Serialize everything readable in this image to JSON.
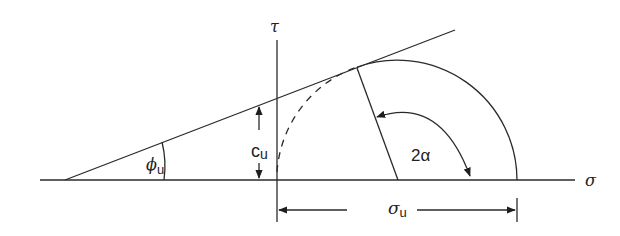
{
  "diagram": {
    "colors": {
      "stroke": "#2a2a2a",
      "background": "#ffffff"
    },
    "labels": {
      "tau_axis": "τ",
      "sigma_axis": "σ",
      "phi_symbol": "ϕ",
      "phi_sub": "u",
      "c_symbol": "c",
      "c_sub": "u",
      "two_alpha": "2α",
      "sigma_u_symbol": "σ",
      "sigma_u_sub": "u"
    },
    "geometry": {
      "sigma_axis": {
        "x1": 40,
        "y": 180,
        "x2": 575
      },
      "tau_axis": {
        "x": 277,
        "y1": 40,
        "y2": 222
      },
      "envelope": {
        "x1": 65,
        "y1": 180,
        "x2": 455,
        "y2": 30
      },
      "circle": {
        "cx": 397,
        "cy": 180,
        "r": 120
      },
      "tangent_point": {
        "x": 357,
        "y": 68
      },
      "sigma_u_dimension_y": 210
    }
  }
}
